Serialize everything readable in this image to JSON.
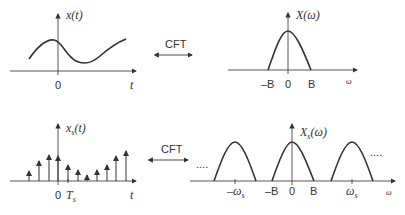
{
  "diagram": {
    "top_left": {
      "label": "x(t)",
      "axis_origin": "0",
      "axis_var": "t"
    },
    "top_transform": {
      "label": "CFT"
    },
    "top_right": {
      "label": "X(ω)",
      "ticks": [
        "–B",
        "0",
        "B"
      ],
      "axis_var": "ω"
    },
    "bottom_left": {
      "label_base": "x",
      "label_sub": "s",
      "label_tail": "(t)",
      "axis_origin": "0",
      "sample_label_base": "T",
      "sample_label_sub": "s",
      "axis_var": "t"
    },
    "bottom_transform": {
      "label": "CFT"
    },
    "bottom_right": {
      "label_base": "X",
      "label_sub": "s",
      "label_tail": "(ω)",
      "ticks": [
        "–ω",
        "–B",
        "0",
        "B",
        "ω"
      ],
      "tick_subs": [
        "s",
        "",
        "",
        "",
        "s"
      ],
      "axis_var": "ω",
      "ellipsis_left": "....",
      "ellipsis_right": "...."
    },
    "colors": {
      "stroke": "#333333",
      "axis": "#555555"
    }
  }
}
